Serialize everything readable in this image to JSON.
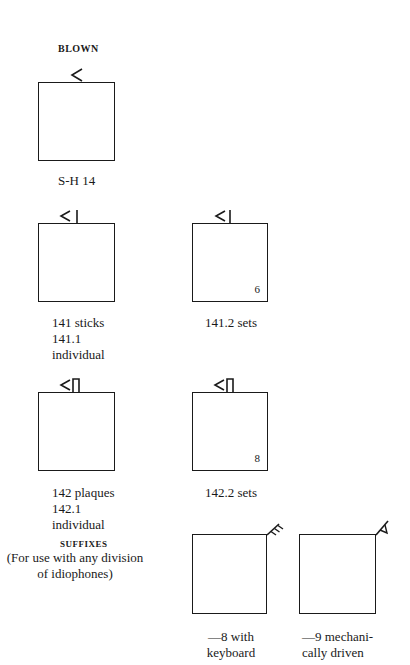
{
  "section_blown": {
    "heading": "BLOWN",
    "figure": {
      "symbol": "less-than-chevron",
      "caption": "S-H 14"
    }
  },
  "row_sticks": {
    "left": {
      "symbol": "chevron-with-stick",
      "caption_lines": [
        "141 sticks",
        "141.1",
        "individual"
      ]
    },
    "right": {
      "symbol": "chevron-with-stick",
      "corner_number": "6",
      "caption": "141.2 sets"
    }
  },
  "row_plaques": {
    "left": {
      "symbol": "chevron-with-plaque",
      "caption_lines": [
        "142 plaques",
        "142.1",
        "individual"
      ]
    },
    "right": {
      "symbol": "chevron-with-plaque",
      "corner_number": "8",
      "caption": "142.2 sets"
    }
  },
  "suffixes": {
    "heading": "SUFFIXES",
    "note_lines": [
      "(For use with any division",
      "of idiophones)"
    ],
    "items": [
      {
        "symbol": "keyboard-comb",
        "caption_lines": [
          "—8 with",
          "keyboard"
        ]
      },
      {
        "symbol": "mechanical-triangle",
        "caption_lines": [
          "—9 mechani-",
          "cally driven"
        ]
      }
    ]
  }
}
